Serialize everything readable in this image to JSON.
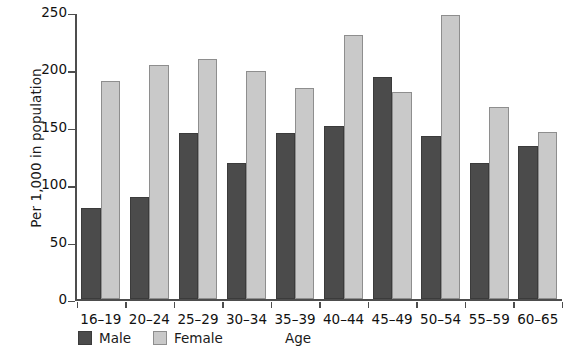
{
  "chart_data": {
    "type": "bar",
    "title": "",
    "xlabel": "Age",
    "ylabel": "Per 1,000 in population",
    "ylim": [
      0,
      250
    ],
    "yticks": [
      0,
      50,
      100,
      150,
      200,
      250
    ],
    "grid": false,
    "legend_position": "bottom-left",
    "categories": [
      "16–19",
      "20–24",
      "25–29",
      "30–34",
      "35–39",
      "40–44",
      "45–49",
      "50–54",
      "55–59",
      "60–65"
    ],
    "series": [
      {
        "name": "Male",
        "color": "#4b4b4b",
        "values": [
          80,
          89,
          145,
          119,
          145,
          151,
          194,
          142,
          119,
          134
        ]
      },
      {
        "name": "Female",
        "color": "#c9c9c9",
        "values": [
          190,
          204,
          209,
          199,
          184,
          230,
          181,
          248,
          168,
          146
        ]
      }
    ]
  },
  "axes": {
    "y_title": "Per 1,000 in population",
    "x_title": "Age",
    "y_tick_labels": [
      "0",
      "50",
      "100",
      "150",
      "200",
      "250"
    ]
  },
  "legend": {
    "items": [
      {
        "label": "Male",
        "swatch": "male-swatch"
      },
      {
        "label": "Female",
        "swatch": "female-swatch"
      }
    ]
  }
}
